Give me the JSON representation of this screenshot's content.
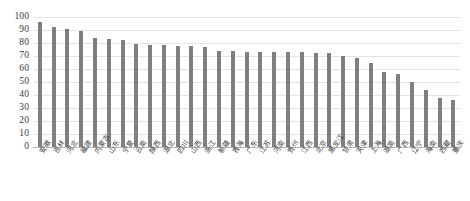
{
  "chart_data": {
    "type": "bar",
    "title": "",
    "subtitle": "",
    "xlabel": "",
    "ylabel": "",
    "ylim": [
      0,
      100
    ],
    "ytick_step": 10,
    "yticks": [
      100,
      90,
      80,
      70,
      60,
      50,
      40,
      30,
      20,
      10,
      0
    ],
    "grid": true,
    "legend": false,
    "legend_position": "none",
    "bar_color": "#7f7f7f",
    "gridline_color": "#e4e4e4",
    "axis_color": "#b9b9b9",
    "categories": [
      "安徽",
      "吉林",
      "河北",
      "福建",
      "内蒙古",
      "山东",
      "宁夏",
      "云南",
      "陕西",
      "湖北",
      "四川",
      "山西",
      "浙江",
      "新疆",
      "青海",
      "广东",
      "江苏",
      "河南",
      "贵州",
      "江西",
      "北京",
      "黑龙江",
      "甘肃",
      "天津",
      "上海",
      "湖南",
      "广西",
      "辽宁",
      "海南",
      "西藏",
      "重庆"
    ],
    "values": [
      96,
      92,
      91,
      89,
      84,
      83,
      82,
      79,
      78.5,
      78.5,
      78,
      78,
      77,
      74,
      73.5,
      73,
      73,
      73,
      73,
      73,
      72.5,
      72,
      70,
      68.5,
      65,
      58,
      56.5,
      50,
      44,
      38,
      36.5
    ]
  }
}
